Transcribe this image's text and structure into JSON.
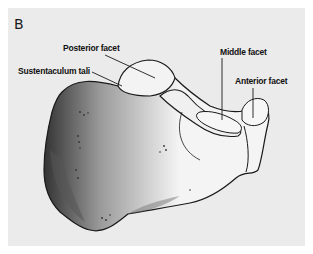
{
  "figure": {
    "panel_letter": "B",
    "labels": {
      "posterior_facet": "Posterior facet",
      "sustentaculum_tali": "Sustentaculum tali",
      "middle_facet": "Middle facet",
      "anterior_facet": "Anterior facet"
    },
    "colors": {
      "background": "#ffffff",
      "panel": "#ebebeb",
      "outline": "#1a1a1a",
      "bone_fill": "#f2f2f2",
      "shadow": "#6a6a6a"
    }
  }
}
